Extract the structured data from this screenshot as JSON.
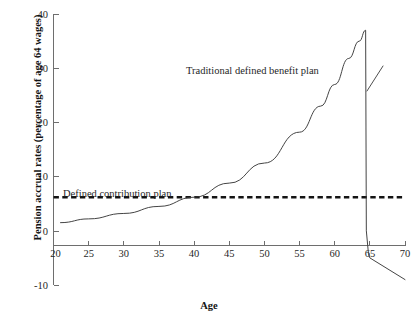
{
  "chart_data": {
    "type": "line",
    "title": "",
    "xlabel": "Age",
    "ylabel": "Pension accrual rates (percentage of age 64 wages)",
    "xlim": [
      20,
      70
    ],
    "ylim": [
      -10,
      40
    ],
    "xticks": [
      20,
      25,
      30,
      35,
      40,
      45,
      50,
      55,
      60,
      65,
      70
    ],
    "xtick_labels": [
      "20",
      "25",
      "30",
      "35",
      "40",
      "45",
      "50",
      "55",
      "60",
      "65",
      "70"
    ],
    "yticks": [
      -10,
      0,
      10,
      20,
      30,
      40
    ],
    "ytick_labels": [
      "-10",
      "0",
      "10",
      "20",
      "30",
      "40"
    ],
    "grid": false,
    "legend_position": "inline-annotations",
    "annotations": [
      {
        "id": "db",
        "text": "Traditional defined benefit plan"
      },
      {
        "id": "dc",
        "text": "Defined contribution plan"
      }
    ],
    "series": [
      {
        "name": "Traditional defined benefit plan",
        "style": "solid",
        "color": "#3a3a3a",
        "x": [
          21,
          25,
          30,
          35,
          40,
          45,
          50,
          55,
          58,
          60,
          62,
          63.5,
          64.4,
          64.5,
          64.8,
          65,
          70
        ],
        "values": [
          1.5,
          2.2,
          3.2,
          4.5,
          6.2,
          8.8,
          12.5,
          18.2,
          23.0,
          27.0,
          31.8,
          35.0,
          37.0,
          0.0,
          -4.2,
          -5.0,
          -9.0
        ]
      },
      {
        "name": "Defined contribution plan",
        "style": "dashed",
        "color": "#141414",
        "x": [
          20,
          70
        ],
        "values": [
          6.2,
          6.2
        ]
      }
    ]
  }
}
